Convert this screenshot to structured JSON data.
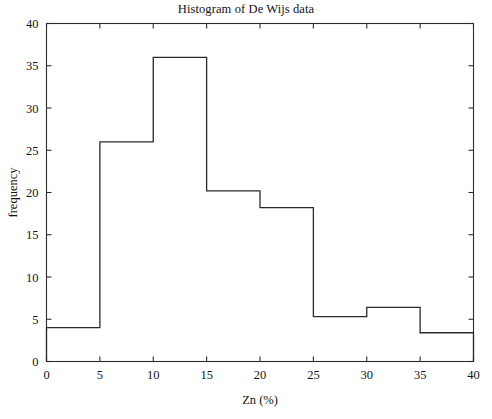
{
  "chart_data": {
    "type": "bar",
    "title": "Histogram of De Wijs data",
    "xlabel": "Zn (%)",
    "ylabel": "frequency",
    "xlim": [
      0,
      40
    ],
    "ylim": [
      0,
      40
    ],
    "grid": false,
    "legend": null,
    "bin_width": 5,
    "bin_edges": [
      0,
      5,
      10,
      15,
      20,
      25,
      30,
      35,
      40
    ],
    "categories": [
      "0-5",
      "5-10",
      "10-15",
      "15-20",
      "20-25",
      "25-30",
      "30-35",
      "35-40"
    ],
    "values": [
      4,
      26,
      36,
      20.2,
      18.2,
      5.3,
      6.4,
      3.4
    ],
    "xticks": [
      0,
      5,
      10,
      15,
      20,
      25,
      30,
      35,
      40
    ],
    "xtick_labels": [
      "0",
      "5",
      "10",
      "15",
      "20",
      "25",
      "30",
      "35",
      "40"
    ],
    "yticks": [
      0,
      5,
      10,
      15,
      20,
      25,
      30,
      35,
      40
    ],
    "ytick_labels": [
      "0",
      "5",
      "10",
      "15",
      "20",
      "25",
      "30",
      "35",
      "40"
    ],
    "line_color": "#2b2b2b",
    "fill_color": "none",
    "background_color": "#ffffff"
  }
}
